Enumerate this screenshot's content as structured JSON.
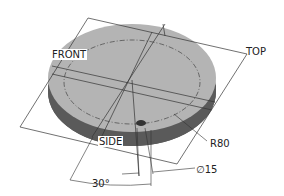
{
  "drawing": {
    "subject": "circular disc with reference planes",
    "colors": {
      "disc_top": "#b4b4b4",
      "disc_side": "#5a5a5a",
      "lines": "#333333",
      "background": "#ffffff"
    },
    "labels": {
      "front": "FRONT",
      "top": "TOP",
      "side": "SIDE",
      "radius": "R80",
      "hole_diameter": "∅15",
      "angle": "30°"
    }
  }
}
